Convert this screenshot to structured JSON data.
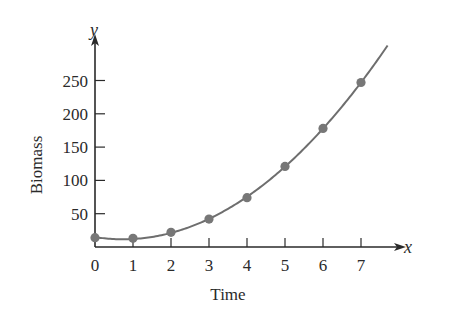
{
  "chart_data": {
    "type": "scatter",
    "title": "",
    "xlabel": "Time",
    "ylabel": "Biomass",
    "x_axis_var": "x",
    "y_axis_var": "y",
    "x": [
      0,
      1,
      2,
      3,
      4,
      5,
      6,
      7
    ],
    "series": [
      {
        "name": "Biomass data",
        "values": [
          14,
          13,
          22,
          42,
          74,
          121,
          178,
          247
        ],
        "marker": "circle",
        "fit_curve": true
      }
    ],
    "xticks": [
      "0",
      "1",
      "2",
      "3",
      "4",
      "5",
      "6",
      "7"
    ],
    "yticks": [
      "50",
      "100",
      "150",
      "200",
      "250"
    ],
    "xlim": [
      0,
      7.7
    ],
    "ylim": [
      0,
      290
    ],
    "grid": false,
    "legend": "none",
    "colors": {
      "axis": "#2a2a2a",
      "curve": "#6e6e6e",
      "marker": "#777777"
    }
  }
}
